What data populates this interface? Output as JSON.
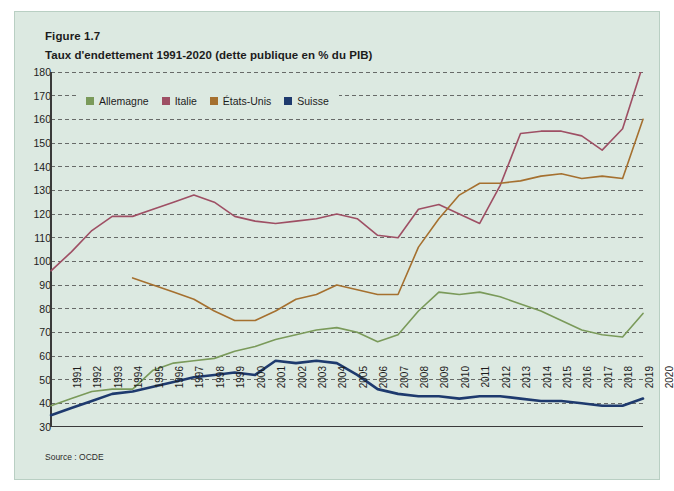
{
  "figure": {
    "number": "Figure 1.7",
    "title": "Taux d'endettement 1991-2020 (dette publique en % du PIB)",
    "source": "Source : OCDE"
  },
  "colors": {
    "background": "#dce9e1",
    "panel_border": "#b9cfc3",
    "grid": "#4a4a4a",
    "axis": "#3a3a3a",
    "allemagne": "#7a9a5a",
    "italie": "#9e4f64",
    "etats_unis": "#a5702f",
    "suisse": "#1e3a6e"
  },
  "legend": {
    "position": "top-left-inside",
    "entries": [
      {
        "label": "Allemagne",
        "color": "#7a9a5a"
      },
      {
        "label": "Italie",
        "color": "#9e4f64"
      },
      {
        "label": "États-Unis",
        "color": "#a5702f"
      },
      {
        "label": "Suisse",
        "color": "#1e3a6e"
      }
    ]
  },
  "chart_data": {
    "type": "line",
    "title": "Taux d'endettement 1991-2020 (dette publique en % du PIB)",
    "xlabel": "",
    "ylabel": "",
    "ylim": [
      30,
      180
    ],
    "ytick_step": 10,
    "yticks": [
      30,
      40,
      50,
      60,
      70,
      80,
      90,
      100,
      110,
      120,
      130,
      140,
      150,
      160,
      170,
      180
    ],
    "grid": "horizontal-dashed",
    "categories": [
      "1991",
      "1992",
      "1993",
      "1994",
      "1995",
      "1996",
      "1997",
      "1998",
      "1999",
      "2000",
      "2001",
      "2002",
      "2003",
      "2004",
      "2005",
      "2006",
      "2007",
      "2008",
      "2009",
      "2010",
      "2011",
      "2012",
      "2013",
      "2014",
      "2015",
      "2016",
      "2017",
      "2018",
      "2019",
      "2020"
    ],
    "series": [
      {
        "name": "Allemagne",
        "color": "#7a9a5a",
        "values": [
          39,
          42,
          45,
          46,
          46,
          54,
          57,
          58,
          59,
          62,
          64,
          67,
          69,
          71,
          72,
          70,
          66,
          69,
          79,
          87,
          86,
          87,
          85,
          82,
          79,
          75,
          71,
          69,
          68,
          78
        ]
      },
      {
        "name": "Italie",
        "color": "#9e4f64",
        "values": [
          96,
          104,
          113,
          119,
          119,
          122,
          125,
          128,
          125,
          119,
          117,
          116,
          117,
          118,
          120,
          118,
          111,
          110,
          122,
          124,
          120,
          116,
          132,
          154,
          155,
          155,
          153,
          147,
          156,
          183
        ]
      },
      {
        "name": "États-Unis",
        "color": "#a5702f",
        "values": [
          null,
          null,
          null,
          null,
          93,
          90,
          87,
          84,
          79,
          75,
          75,
          79,
          84,
          86,
          90,
          88,
          86,
          86,
          106,
          118,
          128,
          133,
          133,
          134,
          136,
          137,
          135,
          136,
          135,
          160
        ]
      },
      {
        "name": "Suisse",
        "color": "#1e3a6e",
        "values": [
          35,
          38,
          41,
          44,
          45,
          47,
          49,
          51,
          52,
          53,
          52,
          58,
          57,
          58,
          57,
          52,
          46,
          44,
          43,
          43,
          42,
          43,
          43,
          42,
          41,
          41,
          40,
          39,
          39,
          42
        ]
      }
    ]
  }
}
